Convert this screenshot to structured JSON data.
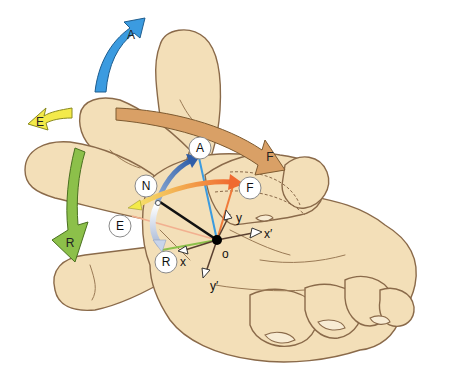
{
  "figure": {
    "colors": {
      "skin": "#f3dfb8",
      "skin_outline": "#8a6a4a",
      "abduction_blue": "#3b9be0",
      "extension_yellow": "#f3ea4a",
      "flexion_tan": "#d9a066",
      "flexion_orange": "#f07a3a",
      "retroposition_green": "#8cc04a",
      "neutral_white": "#ffffff"
    },
    "large_arrows": [
      {
        "id": "A",
        "label": "A",
        "color": "#3b9be0"
      },
      {
        "id": "E",
        "label": "E",
        "color": "#f3ea4a"
      },
      {
        "id": "F",
        "label": "F",
        "color": "#d9a066"
      },
      {
        "id": "R",
        "label": "R",
        "color": "#8cc04a"
      }
    ],
    "circle_labels": [
      {
        "id": "A",
        "label": "A"
      },
      {
        "id": "N",
        "label": "N"
      },
      {
        "id": "F",
        "label": "F"
      },
      {
        "id": "E",
        "label": "E"
      },
      {
        "id": "R",
        "label": "R"
      }
    ],
    "axes": {
      "origin": "o",
      "x": "x",
      "x_prime": "x′",
      "y": "y",
      "y_prime": "y′"
    }
  }
}
